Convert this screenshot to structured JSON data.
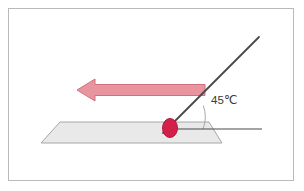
{
  "figure": {
    "type": "physics-vector-diagram",
    "background_color": "#ffffff",
    "frame": {
      "name": "figure-border",
      "color": "#b9b9b9",
      "width": 286,
      "height": 173
    }
  },
  "annotations": {
    "angle_label": "45℃",
    "angle_label_color": "#3a3a3a",
    "angle_value": 45,
    "angle_unit": "℃"
  },
  "elements": {
    "plane": {
      "name": "horizontal-plane",
      "shape": "parallelogram",
      "fill": "#e9e9e9",
      "stroke": "#a6a6a6",
      "points": "41,143 60,122 209,122 222,143"
    },
    "incline_line": {
      "name": "inclined-line",
      "stroke": "#4a4a4a",
      "stroke_width": 1.8,
      "x1": 259,
      "y1": 37,
      "x2": 163,
      "y2": 133
    },
    "horizontal_line": {
      "name": "horizontal-reference-line",
      "stroke": "#4a4a4a",
      "stroke_width": 1.1,
      "x1": 168,
      "y1": 129,
      "x2": 262,
      "y2": 129
    },
    "angle_arc": {
      "name": "angle-arc",
      "stroke": "#a8a8a8",
      "stroke_width": 1,
      "radius": 33
    },
    "contact_point": {
      "name": "contact-point-marker",
      "shape": "ellipse",
      "fill": "#d3204a",
      "stroke": "#b01a3f",
      "cx": 170,
      "cy": 128,
      "rx": 7.5,
      "ry": 9.5
    },
    "force_arrow": {
      "name": "force-arrow",
      "direction": "left",
      "fill": "#e8959f",
      "stroke": "#d2707f",
      "shaft_y": 90,
      "shaft_left": 95,
      "shaft_right": 205,
      "tip_x": 77,
      "half_shaft": 5.5,
      "half_head": 11
    }
  }
}
